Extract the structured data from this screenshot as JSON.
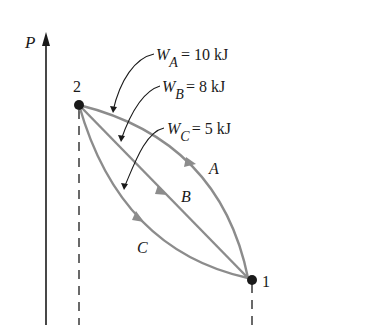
{
  "diagram": {
    "axis": {
      "label": "P"
    },
    "states": [
      {
        "id": "state-2",
        "label": "2"
      },
      {
        "id": "state-1",
        "label": "1"
      }
    ],
    "paths": [
      {
        "name": "A",
        "label": "A",
        "work_symbol": "W",
        "work_sub": "A",
        "work_value": "= 10 kJ"
      },
      {
        "name": "B",
        "label": "B",
        "work_symbol": "W",
        "work_sub": "B",
        "work_value": "= 8 kJ"
      },
      {
        "name": "C",
        "label": "C",
        "work_symbol": "W",
        "work_sub": "C",
        "work_value": "= 5 kJ"
      }
    ],
    "colors": {
      "curve": "#8c8c8c",
      "ink": "#1a1a1a",
      "background": "#ffffff"
    }
  }
}
